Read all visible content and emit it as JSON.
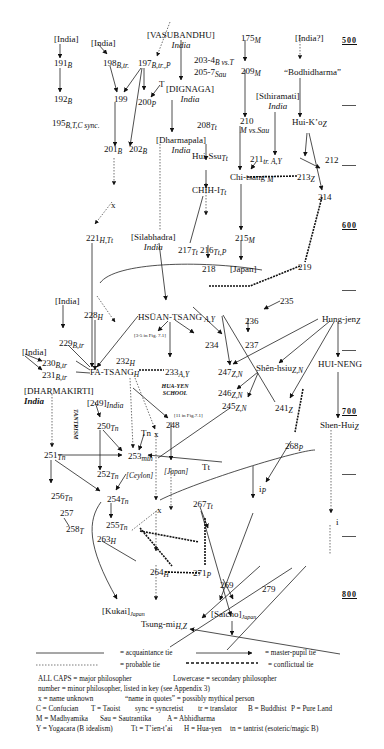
{
  "timeline": {
    "years": [
      "500",
      "600",
      "700",
      "800"
    ],
    "tick_count": 12
  },
  "nodes": {
    "india1": {
      "label": "[India]"
    },
    "n191": {
      "label": "191",
      "sub": "B"
    },
    "n192": {
      "label": "192",
      "sub": "B"
    },
    "n195": {
      "label": "195",
      "sub": "B,T,C sync."
    },
    "india2": {
      "label": "[India]"
    },
    "n198": {
      "label": "198",
      "sub": "B,tr."
    },
    "vasubandhu": {
      "label": "[VASUBANDHU]",
      "region": "India"
    },
    "n197": {
      "label": "197",
      "sub": "B,tr.,P"
    },
    "t1": {
      "label": "T"
    },
    "n199": {
      "label": "199"
    },
    "n200": {
      "label": "200",
      "sub": "P"
    },
    "dignaga": {
      "label": "[DIGNAGA]",
      "region": "India"
    },
    "n201": {
      "label": "201",
      "sub": "B"
    },
    "n202": {
      "label": "202",
      "sub": "B"
    },
    "dharmapala": {
      "label": "[Dharmapala]",
      "region": "India"
    },
    "n175": {
      "label": "175",
      "sub": "M"
    },
    "n203": {
      "label": "203-4",
      "sub": "B vs.T"
    },
    "n205": {
      "label": "205-7",
      "sub": "Sau"
    },
    "n209": {
      "label": "209",
      "sub": "M"
    },
    "india3": {
      "label": "[India?]"
    },
    "bodhidharma": {
      "label": "“Bodhidharma”"
    },
    "n208": {
      "label": "208",
      "sub": "Tt"
    },
    "sthiramati": {
      "label": "[Sthiramati]",
      "region": "India"
    },
    "n210": {
      "label": "210",
      "sub2": "M vs.Sau"
    },
    "huikoz": {
      "label": "Hui-K’o",
      "sub": "Z"
    },
    "huissu": {
      "label": "Hui-Ssu",
      "sub": "Tt"
    },
    "n211": {
      "label": "211",
      "sub": "tr. A,Y"
    },
    "n212": {
      "label": "212"
    },
    "chitsang": {
      "label": "Chi-tsang",
      "sub": "M"
    },
    "n213": {
      "label": "213",
      "sub": "Z"
    },
    "n214": {
      "label": "214"
    },
    "chihi": {
      "label": "CHIH-I",
      "sub": "Tt"
    },
    "x1": {
      "label": "x"
    },
    "n221": {
      "label": "221",
      "sub": "H,Tt"
    },
    "silabhadra": {
      "label": "[Silabhadra]",
      "region": "India"
    },
    "n217": {
      "label": "217",
      "sub": "Tt"
    },
    "n216": {
      "label": "216",
      "sub": "Tt,P"
    },
    "n215": {
      "label": "215",
      "sub": "M"
    },
    "n218": {
      "label": "218"
    },
    "japan1": {
      "label": "[Japan]"
    },
    "n219": {
      "label": "219"
    },
    "n235": {
      "label": "235"
    },
    "india4": {
      "label": "[India]"
    },
    "n228": {
      "label": "228",
      "sub": "H"
    },
    "hsuantsang": {
      "label": "HSÜAN-TSANG",
      "sub": "A,Y"
    },
    "n236": {
      "label": "236"
    },
    "n237": {
      "label": "237"
    },
    "hungjen": {
      "label": "Hung-jen",
      "sub": "Z"
    },
    "n229": {
      "label": "229",
      "sub": "B,tr"
    },
    "ref35": {
      "label": "[3-5 in Fig. 7.1]"
    },
    "n234": {
      "label": "234"
    },
    "india5": {
      "label": "[India]"
    },
    "n230": {
      "label": "230",
      "sub": "B,tr"
    },
    "n232": {
      "label": "232",
      "sub": "H"
    },
    "n247": {
      "label": "247",
      "sub": "Z,N"
    },
    "shenhsiu": {
      "label": "Shên-hsiu",
      "sub": "Z,N"
    },
    "huineng": {
      "label": "HUI-NENG"
    },
    "n231": {
      "label": "231",
      "sub": "B,tr"
    },
    "fatsang": {
      "label": "FA-TSANG",
      "sub": "H"
    },
    "n233": {
      "label": "233",
      "sub": "A,Y"
    },
    "dharmakirti": {
      "label": "[DHARMAKIRTI]",
      "region": "India"
    },
    "huayen": {
      "label": "HUA-YEN SCHOOL"
    },
    "n246": {
      "label": "246",
      "sub": "Z,N"
    },
    "n245": {
      "label": "245",
      "sub": "Z,N"
    },
    "n241": {
      "label": "241",
      "sub": "Z"
    },
    "shenhui": {
      "label": "Shen-Hui",
      "sub": "Z"
    },
    "n249": {
      "label": "[249]",
      "sub": "India"
    },
    "ref11": {
      "label": "[11 in Fig.7.1]"
    },
    "tantrism": {
      "label": "TANTRISM"
    },
    "n250": {
      "label": "250",
      "sub": "Tn"
    },
    "n248": {
      "label": "248"
    },
    "x2": {
      "label": "x"
    },
    "tn1": {
      "label": "Tn"
    },
    "n268": {
      "label": "268",
      "sub": "P"
    },
    "n251": {
      "label": "251",
      "sub": "Tn"
    },
    "n253": {
      "label": "253",
      "sub": "mth"
    },
    "ceylon": {
      "label": "[Ceylon]"
    },
    "n252": {
      "label": "252",
      "sub": "Tn"
    },
    "japan2": {
      "label": "[Japan]"
    },
    "tt1": {
      "label": "Tt"
    },
    "ip": {
      "label": "i",
      "sub": "P"
    },
    "n256": {
      "label": "256",
      "sub": "Tn"
    },
    "n254": {
      "label": "254",
      "sub": "Tn"
    },
    "n257": {
      "label": "257"
    },
    "n267": {
      "label": "267",
      "sub": "Tt"
    },
    "x3": {
      "label": "x"
    },
    "n258": {
      "label": "258",
      "sub": "T"
    },
    "n255": {
      "label": "255",
      "sub": "Tn"
    },
    "i2": {
      "label": "i"
    },
    "n263": {
      "label": "263",
      "sub": "H"
    },
    "n264": {
      "label": "264",
      "sub": "H"
    },
    "n271": {
      "label": "271",
      "sub": "P"
    },
    "n269": {
      "label": "269"
    },
    "n279": {
      "label": "279"
    },
    "kukai": {
      "label": "[Kukai]",
      "sub": "Japan"
    },
    "saicho": {
      "label": "[Saicho]",
      "sub": "Japan"
    },
    "tsungmi": {
      "label": "Tsung-mi",
      "sub": "H,Z"
    }
  },
  "legend": {
    "acquaintance": "= acquaintance tie",
    "master_pupil": "= master-pupil tie",
    "probable": "= probable tie",
    "conflictual": "= conflictual tie",
    "lines": [
      [
        "ALL CAPS  = major philosopher",
        "Lowercase  = secondary philosopher"
      ],
      [
        "number  = minor philosopher, listed in key (see Appendix 3)"
      ],
      [
        "x = name unknown",
        "“name in quotes” = possibly mythical person"
      ],
      [
        "C = Confucian",
        "T = Taoist",
        "sync = syncretist",
        "tr = translator",
        "B = Buddhist",
        "P = Pure Land"
      ],
      [
        "M = Madhyamika",
        "Sau = Sautrantika",
        "A = Abhidharma"
      ],
      [
        "Y = Yogacara (B idealism)",
        "Tt = T’ien-t’ai",
        "H = Hua-yen",
        "tn = tantrist (esoteric/magic B)"
      ]
    ]
  }
}
